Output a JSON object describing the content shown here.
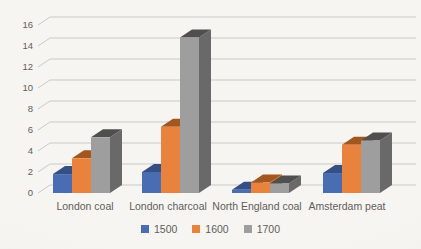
{
  "chart_data": {
    "type": "bar",
    "variant": "3d-clustered",
    "title": "",
    "xlabel": "",
    "ylabel": "",
    "categories": [
      "London coal",
      "London charcoal",
      "North England coal",
      "Amsterdam peat"
    ],
    "series": [
      {
        "name": "1500",
        "color": "#4a6cb3",
        "top_color": "#354f84",
        "side_color": "#3d5b99",
        "values": [
          1.8,
          2.0,
          0.3,
          1.9
        ]
      },
      {
        "name": "1600",
        "color": "#e8823c",
        "top_color": "#a3561e",
        "side_color": "#c06524",
        "values": [
          3.3,
          6.3,
          1.0,
          4.6
        ]
      },
      {
        "name": "1700",
        "color": "#9e9e9e",
        "top_color": "#4f4f4f",
        "side_color": "#696969",
        "values": [
          5.3,
          14.8,
          0.9,
          5.0
        ]
      }
    ],
    "ylim": [
      0,
      16
    ],
    "y_tick_step": 2,
    "y_ticks": [
      "0",
      "2",
      "4",
      "6",
      "8",
      "10",
      "12",
      "14",
      "16"
    ],
    "grid": true,
    "legend_position": "bottom"
  },
  "page": {
    "background": "#f4f3f0",
    "text_color": "#5f5e5c",
    "gridline_color": "#ccc9c5"
  }
}
